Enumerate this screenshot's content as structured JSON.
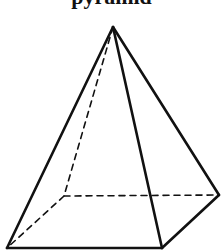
{
  "title": "pyramid",
  "figure": {
    "type": "square-pyramid",
    "stroke_color": "#111111",
    "apex": [
      113,
      27
    ],
    "base": {
      "front_left": [
        7,
        248
      ],
      "front_right": [
        162,
        248
      ],
      "back_right": [
        219,
        195
      ],
      "back_left": [
        64,
        196
      ]
    },
    "hidden_edges": [
      "apex-back_left",
      "back_left-front_left",
      "back_left-back_right"
    ],
    "visible_edges": [
      "apex-front_left",
      "apex-front_right",
      "apex-back_right",
      "front_left-front_right",
      "front_right-back_right"
    ]
  }
}
